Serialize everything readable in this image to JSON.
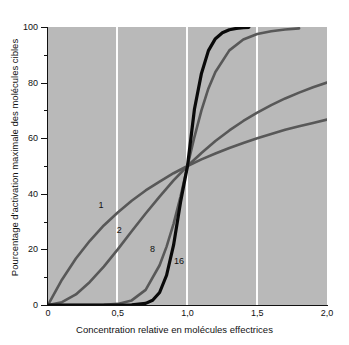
{
  "chart_data": {
    "type": "line",
    "title": "",
    "xlabel": "Concentration relative en molécules effectrices",
    "ylabel": "Pourcentage d'activation maximale des molécules cibles",
    "xlim": [
      0,
      2.0
    ],
    "ylim": [
      0,
      100
    ],
    "grid": true,
    "grid_axis": "x",
    "grid_color": "#fdfdfd",
    "plot_background": "#b9b9b9",
    "legend": "inline-curve-labels",
    "x_ticks": [
      {
        "value": 0,
        "label": "0"
      },
      {
        "value": 0.5,
        "label": "0,5"
      },
      {
        "value": 1.0,
        "label": "1,0"
      },
      {
        "value": 1.5,
        "label": "1,5"
      },
      {
        "value": 2.0,
        "label": "2,0"
      }
    ],
    "y_ticks_major": [
      {
        "value": 0,
        "label": "0"
      },
      {
        "value": 20,
        "label": "20"
      },
      {
        "value": 40,
        "label": "40"
      },
      {
        "value": 60,
        "label": "60"
      },
      {
        "value": 80,
        "label": "80"
      },
      {
        "value": 100,
        "label": "100"
      }
    ],
    "y_ticks_minor": [
      10,
      30,
      50,
      70,
      90
    ],
    "series": [
      {
        "name": "1",
        "hill_coefficient": 1,
        "color": "#585858",
        "width": 2.6,
        "x_end": 2.0,
        "label": "1",
        "label_x": 0.38,
        "label_y": 36,
        "x": [
          0.0,
          0.1,
          0.2,
          0.3,
          0.4,
          0.5,
          0.6,
          0.7,
          0.8,
          0.9,
          1.0,
          1.1,
          1.2,
          1.3,
          1.4,
          1.5,
          1.6,
          1.7,
          1.8,
          1.9,
          2.0
        ],
        "y": [
          0.0,
          9.1,
          16.7,
          23.1,
          28.6,
          33.3,
          37.5,
          41.2,
          44.4,
          47.4,
          50.0,
          52.4,
          54.5,
          56.5,
          58.3,
          60.0,
          61.5,
          63.0,
          64.3,
          65.5,
          66.7
        ]
      },
      {
        "name": "2",
        "hill_coefficient": 2,
        "color": "#585858",
        "width": 2.6,
        "x_end": 2.0,
        "label": "2",
        "label_x": 0.51,
        "label_y": 27,
        "x": [
          0.0,
          0.1,
          0.2,
          0.3,
          0.4,
          0.5,
          0.6,
          0.7,
          0.8,
          0.9,
          1.0,
          1.1,
          1.2,
          1.3,
          1.4,
          1.5,
          1.6,
          1.7,
          1.8,
          1.9,
          2.0
        ],
        "y": [
          0.0,
          1.0,
          3.8,
          8.3,
          13.8,
          20.0,
          26.5,
          32.9,
          39.0,
          44.8,
          50.0,
          54.7,
          59.0,
          62.8,
          66.2,
          69.2,
          71.9,
          74.3,
          76.4,
          78.3,
          80.0
        ]
      },
      {
        "name": "8",
        "hill_coefficient": 8,
        "color": "#585858",
        "width": 2.6,
        "x_end": 1.8,
        "label": "8",
        "label_x": 0.75,
        "label_y": 20,
        "x": [
          0.0,
          0.2,
          0.4,
          0.5,
          0.6,
          0.7,
          0.8,
          0.85,
          0.9,
          0.95,
          1.0,
          1.05,
          1.1,
          1.15,
          1.2,
          1.3,
          1.4,
          1.5,
          1.6,
          1.7,
          1.8
        ],
        "y": [
          0.0,
          0.0,
          0.07,
          0.39,
          1.65,
          5.45,
          14.3,
          21.0,
          29.2,
          39.0,
          50.0,
          60.5,
          70.0,
          77.9,
          83.8,
          91.6,
          95.5,
          97.5,
          98.5,
          99.1,
          99.5
        ]
      },
      {
        "name": "16",
        "hill_coefficient": 16,
        "color": "#0a0a0a",
        "width": 3.2,
        "x_end": 1.44,
        "label": "16",
        "label_x": 0.94,
        "label_y": 16,
        "x": [
          0.0,
          0.3,
          0.5,
          0.6,
          0.7,
          0.75,
          0.8,
          0.85,
          0.9,
          0.95,
          1.0,
          1.05,
          1.1,
          1.15,
          1.2,
          1.25,
          1.3,
          1.35,
          1.4,
          1.44
        ],
        "y": [
          0.0,
          0.0,
          0.0,
          0.03,
          0.58,
          1.7,
          4.5,
          10.7,
          21.5,
          37.0,
          50.0,
          70.5,
          83.3,
          91.5,
          95.8,
          97.9,
          99.0,
          99.5,
          99.8,
          99.9
        ]
      }
    ]
  }
}
